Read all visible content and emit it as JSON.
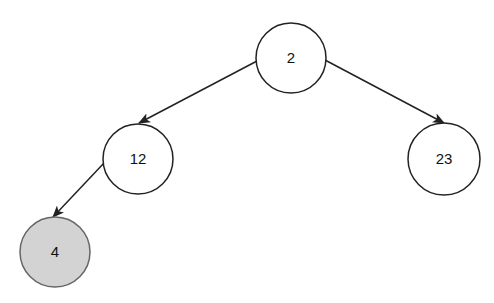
{
  "diagram": {
    "type": "binary-tree",
    "colors": {
      "edge": "#222222",
      "node_border": "#222222",
      "node_fill": "#ffffff",
      "highlight_fill": "#d3d3d3",
      "highlight_border": "#666666"
    },
    "nodes": [
      {
        "id": "n2",
        "label": "2",
        "cx": 291,
        "cy": 58,
        "r": 35,
        "highlighted": false
      },
      {
        "id": "n12",
        "label": "12",
        "cx": 138,
        "cy": 159,
        "r": 35,
        "highlighted": false
      },
      {
        "id": "n23",
        "label": "23",
        "cx": 444,
        "cy": 159,
        "r": 36,
        "highlighted": false
      },
      {
        "id": "n4",
        "label": "4",
        "cx": 55,
        "cy": 252,
        "r": 35,
        "highlighted": true
      }
    ],
    "edges": [
      {
        "from": "2",
        "to": "12",
        "x1": 257,
        "y1": 61,
        "x2": 139,
        "y2": 123
      },
      {
        "from": "2",
        "to": "23",
        "x1": 325,
        "y1": 60,
        "x2": 444,
        "y2": 123
      },
      {
        "from": "12",
        "to": "4",
        "x1": 104,
        "y1": 163,
        "x2": 53,
        "y2": 217
      }
    ]
  }
}
